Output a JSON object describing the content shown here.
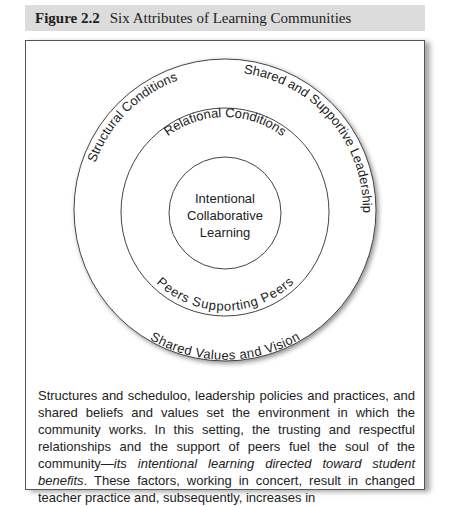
{
  "caption": {
    "figure_number": "Figure 2.2",
    "title": "Six Attributes of Learning Communities"
  },
  "diagram": {
    "center": "Intentional Collaborative Learning",
    "center_lines": [
      "Intentional",
      "Collaborative",
      "Learning"
    ],
    "middle_ring": {
      "top_label": "Relational Conditions",
      "bottom_label": "Peers Supporting Peers"
    },
    "outer_ring": {
      "top_left_label": "Structural Conditions",
      "top_right_label": "Shared and Supportive Leadership",
      "bottom_label": "Shared Values and Vision"
    },
    "colors": {
      "caption_bg": "#dcdcdc",
      "stroke": "#444444",
      "text": "#222222"
    }
  },
  "description": {
    "part1": "Structures and scheduloo, leadership policies and practices, and shared beliefs and values set the environment in which the community works. In this setting, the trusting and respectful relationships and the support of peers fuel the soul of the community—",
    "italic": "its intentional learning directed toward student benefits",
    "part2": ". These factors, working in concert, result in changed teacher practice and, subsequently, increases in"
  }
}
